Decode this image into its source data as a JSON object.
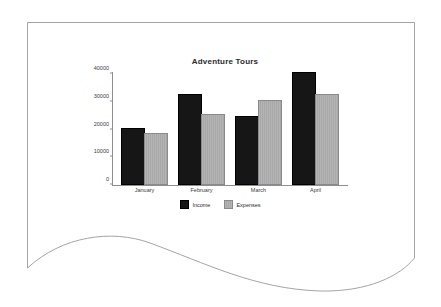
{
  "paper": {
    "background_color": "#ffffff",
    "edge_color": "#9a9a9a",
    "description": "curved-paper-sheet"
  },
  "chart_data": {
    "type": "bar",
    "title": "Adventure Tours",
    "xlabel": "",
    "ylabel": "",
    "categories": [
      "January",
      "February",
      "March",
      "April"
    ],
    "series": [
      {
        "name": "Income",
        "color": "#161616",
        "values": [
          20000,
          32000,
          24000,
          40000
        ]
      },
      {
        "name": "Expenses",
        "color": "#b4b4b4",
        "values": [
          18000,
          25000,
          30000,
          32000
        ]
      }
    ],
    "ylim": [
      0,
      40000
    ],
    "yticks": [
      0,
      10000,
      20000,
      30000,
      40000
    ],
    "ytick_labels": [
      "0",
      "10000",
      "20000",
      "30000",
      "40000"
    ],
    "grid": false,
    "legend_position": "bottom"
  },
  "axis": {
    "tick_0": "0",
    "tick_10000": "10000",
    "tick_20000": "20000",
    "tick_30000": "30000",
    "tick_40000": "40000"
  },
  "legend": {
    "items": [
      {
        "label": "Income"
      },
      {
        "label": "Expenses"
      }
    ]
  }
}
